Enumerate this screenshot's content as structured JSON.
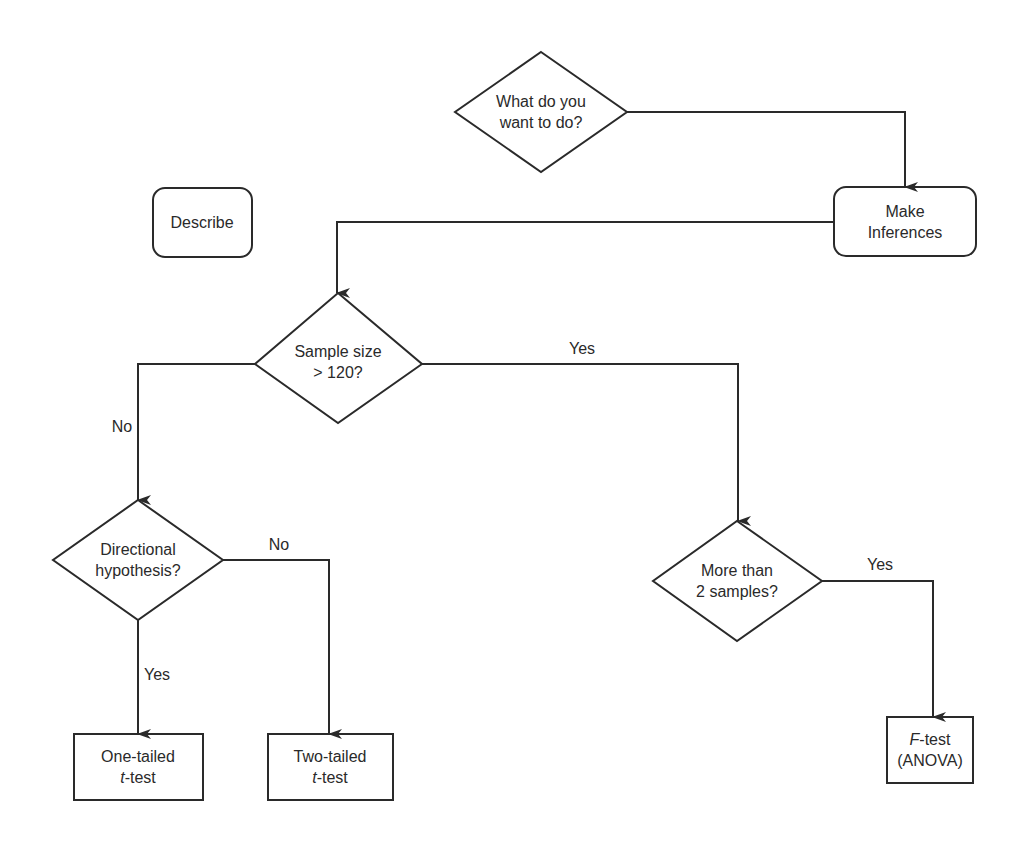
{
  "diagram": {
    "type": "flowchart",
    "colors": {
      "stroke": "#2a2a2a",
      "background": "#ffffff",
      "text": "#2a2a2a"
    },
    "nodes": {
      "start": {
        "shape": "diamond",
        "line1": "What do you",
        "line2": "want to do?"
      },
      "describe": {
        "shape": "rounded-rect",
        "label": "Describe"
      },
      "inferences": {
        "shape": "rounded-rect",
        "line1": "Make",
        "line2": "Inferences"
      },
      "sample_size": {
        "shape": "diamond",
        "line1": "Sample size",
        "line2": "> 120?"
      },
      "directional": {
        "shape": "diamond",
        "line1": "Directional",
        "line2": "hypothesis?"
      },
      "more_samples": {
        "shape": "diamond",
        "line1": "More than",
        "line2": "2 samples?"
      },
      "one_tailed": {
        "shape": "rect",
        "line1": "One-tailed",
        "line2_italic": "t",
        "line2_rest": "-test"
      },
      "two_tailed": {
        "shape": "rect",
        "line1": "Two-tailed",
        "line2_italic": "t",
        "line2_rest": "-test"
      },
      "f_test": {
        "shape": "rect",
        "line1_italic": "F",
        "line1_rest": "-test",
        "line2": "(ANOVA)"
      }
    },
    "edges": {
      "start_to_inferences": {
        "from": "start",
        "to": "inferences",
        "label": ""
      },
      "inferences_to_sample_size": {
        "from": "inferences",
        "to": "sample_size",
        "label": ""
      },
      "sample_no": {
        "from": "sample_size",
        "to": "directional",
        "label": "No"
      },
      "sample_yes": {
        "from": "sample_size",
        "to": "more_samples",
        "label": "Yes"
      },
      "directional_no": {
        "from": "directional",
        "to": "two_tailed",
        "label": "No"
      },
      "directional_yes": {
        "from": "directional",
        "to": "one_tailed",
        "label": "Yes"
      },
      "more_samples_yes": {
        "from": "more_samples",
        "to": "f_test",
        "label": "Yes"
      }
    }
  }
}
